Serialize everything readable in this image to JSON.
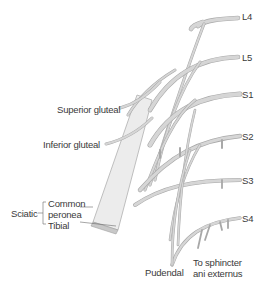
{
  "diagram": {
    "roots": [
      {
        "label": "L4"
      },
      {
        "label": "L5"
      },
      {
        "label": "S1"
      },
      {
        "label": "S2"
      },
      {
        "label": "S3"
      },
      {
        "label": "S4"
      }
    ],
    "branches": {
      "superior_gluteal": "Superior gluteal",
      "inferior_gluteal": "Inferior gluteal",
      "sciatic": "Sciatic",
      "common_peronea": "Common",
      "common_peronea_2": "peronea",
      "tibial": "Tibial",
      "pudendal": "Pudendal",
      "sphincter_1": "To sphincter",
      "sphincter_2": "ani externus"
    },
    "colors": {
      "nerve_fill": "#e4e4e4",
      "nerve_edge": "#a8a8a8",
      "text": "#3a3a3a",
      "background": "#ffffff"
    }
  }
}
